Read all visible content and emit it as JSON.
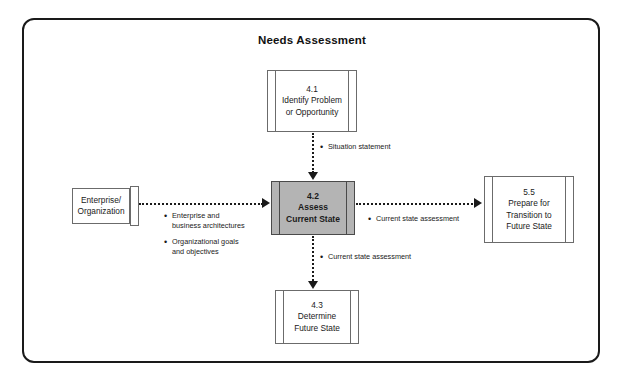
{
  "diagram": {
    "title": "Needs Assessment",
    "type": "process-flow-diagram"
  },
  "nodes": {
    "enterprise": {
      "line1": "Enterprise/",
      "line2": "Organization"
    },
    "box_41": {
      "number": "4.1",
      "line1": "Identify Problem",
      "line2": "or Opportunity"
    },
    "box_42": {
      "number": "4.2",
      "line1": "Assess",
      "line2": "Current State",
      "fill_color": "#b4b4b4"
    },
    "box_43": {
      "number": "4.3",
      "line1": "Determine",
      "line2": "Future State"
    },
    "box_55": {
      "number": "5.5",
      "line1": "Prepare for",
      "line2": "Transition to",
      "line3": "Future State"
    }
  },
  "flow_labels": {
    "situation_statement": "Situation statement",
    "current_state_right": "Current state assessment",
    "current_state_down": "Current state assessment",
    "inputs": [
      {
        "line1": "Enterprise and",
        "line2": "business architectures"
      },
      {
        "line1": "Organizational goals",
        "line2": "and objectives"
      }
    ],
    "bullet_glyph": "•"
  }
}
